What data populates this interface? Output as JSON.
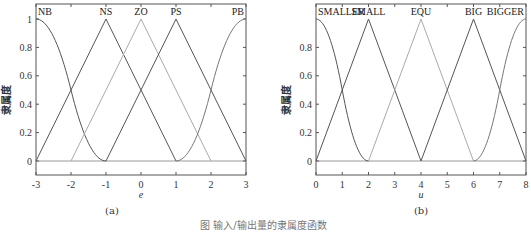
{
  "figure_caption": "图 输入/输出量的隶属度函数",
  "chart_data": [
    {
      "type": "line",
      "panel": "(a)",
      "title": "",
      "xlabel": "e",
      "ylabel": "隶属度",
      "xlim": [
        -3,
        3
      ],
      "ylim": [
        -0.15,
        1.1
      ],
      "xticks": [
        "-3",
        "-2",
        "-1",
        "0",
        "1",
        "2",
        "3"
      ],
      "yticks": [
        "0",
        "0.2",
        "0.4",
        "0.6",
        "0.8",
        "1"
      ],
      "grid": false,
      "series": [
        {
          "name": "NB",
          "shape": "z-curve",
          "x": [
            -3,
            -1
          ],
          "y": [
            1,
            0
          ],
          "color": "#555555"
        },
        {
          "name": "NS",
          "shape": "triangle",
          "x": [
            -3,
            -1,
            1
          ],
          "y": [
            0,
            1,
            0
          ],
          "color": "#555555"
        },
        {
          "name": "ZO",
          "shape": "triangle",
          "x": [
            -2,
            0,
            2
          ],
          "y": [
            0,
            1,
            0
          ],
          "color": "#aaaaaa"
        },
        {
          "name": "PS",
          "shape": "triangle",
          "x": [
            -1,
            1,
            3
          ],
          "y": [
            0,
            1,
            0
          ],
          "color": "#555555"
        },
        {
          "name": "PB",
          "shape": "s-curve",
          "x": [
            1,
            3
          ],
          "y": [
            0,
            1
          ],
          "color": "#777777"
        }
      ]
    },
    {
      "type": "line",
      "panel": "(b)",
      "title": "",
      "xlabel": "u",
      "ylabel": "隶属度",
      "xlim": [
        0,
        8
      ],
      "ylim": [
        -0.15,
        1.1
      ],
      "xticks": [
        "0",
        "1",
        "2",
        "3",
        "4",
        "5",
        "6",
        "7",
        "8"
      ],
      "yticks": [
        "0",
        "0.2",
        "0.4",
        "0.6",
        "0.8"
      ],
      "grid": false,
      "series": [
        {
          "name": "SMALLER",
          "shape": "z-curve",
          "x": [
            0,
            2
          ],
          "y": [
            1,
            0
          ],
          "color": "#555555"
        },
        {
          "name": "SMALL",
          "shape": "triangle",
          "x": [
            0,
            2,
            4
          ],
          "y": [
            0,
            1,
            0
          ],
          "color": "#555555"
        },
        {
          "name": "EQU",
          "shape": "triangle",
          "x": [
            2,
            4,
            6
          ],
          "y": [
            0,
            1,
            0
          ],
          "color": "#aaaaaa"
        },
        {
          "name": "BIG",
          "shape": "triangle",
          "x": [
            4,
            6,
            8
          ],
          "y": [
            0,
            1,
            0
          ],
          "color": "#555555"
        },
        {
          "name": "BIGGER",
          "shape": "s-curve",
          "x": [
            6,
            8
          ],
          "y": [
            0,
            1
          ],
          "color": "#777777"
        }
      ]
    }
  ]
}
